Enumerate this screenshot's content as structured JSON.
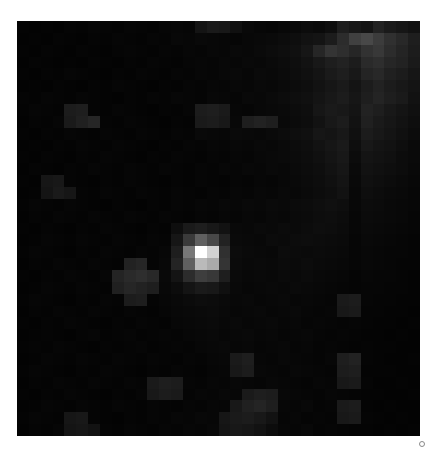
{
  "figure": {
    "type": "astronomical-image",
    "title": "",
    "background_color": "#ffffff",
    "panel": {
      "x": 17,
      "y": 21,
      "width": 403,
      "height": 415,
      "background_color": "#000000",
      "border": "none"
    },
    "marker": {
      "name": "corner-dot-marker",
      "shape": "circle",
      "x": 422,
      "y": 444,
      "diameter_px": 6,
      "stroke_color": "#8a8a8a",
      "fill_color": "#ffffff"
    }
  },
  "chart_data": {
    "type": "heatmap",
    "title": "",
    "subtitle": "",
    "xlabel": "",
    "ylabel": "",
    "colormap": "gray",
    "grid": false,
    "legend": "none",
    "xticks": [],
    "yticks": [],
    "cols": 34,
    "rows": 35,
    "cell_px": 11.85,
    "vmin": 0,
    "vmax": 255,
    "annotations": [
      {
        "label": "central point source",
        "col": 17,
        "row": 18,
        "peak_value": 255
      },
      {
        "label": "secondary faint clump",
        "col": 9,
        "row": 20,
        "peak_value": 46
      },
      {
        "label": "bright upper-right noise patch",
        "col": 30,
        "row": 1,
        "peak_value": 72
      }
    ],
    "values": [
      [
        4,
        3,
        4,
        3,
        5,
        4,
        6,
        5,
        4,
        6,
        5,
        4,
        6,
        7,
        6,
        20,
        26,
        24,
        16,
        9,
        7,
        6,
        8,
        9,
        12,
        10,
        14,
        30,
        24,
        20,
        34,
        26,
        22,
        18
      ],
      [
        3,
        4,
        3,
        5,
        4,
        3,
        5,
        4,
        6,
        5,
        4,
        6,
        5,
        8,
        7,
        9,
        8,
        7,
        6,
        8,
        9,
        10,
        12,
        14,
        18,
        20,
        28,
        44,
        64,
        72,
        60,
        48,
        40,
        30
      ],
      [
        4,
        3,
        5,
        4,
        3,
        5,
        4,
        3,
        5,
        6,
        5,
        4,
        6,
        5,
        7,
        6,
        8,
        7,
        9,
        8,
        10,
        12,
        14,
        16,
        22,
        38,
        52,
        46,
        38,
        50,
        56,
        44,
        36,
        28
      ],
      [
        3,
        5,
        4,
        3,
        4,
        3,
        5,
        4,
        3,
        5,
        4,
        6,
        5,
        4,
        6,
        7,
        6,
        8,
        7,
        9,
        8,
        10,
        12,
        14,
        18,
        24,
        30,
        34,
        28,
        42,
        46,
        38,
        34,
        26
      ],
      [
        4,
        3,
        5,
        4,
        6,
        5,
        4,
        3,
        5,
        4,
        6,
        5,
        4,
        6,
        5,
        7,
        6,
        8,
        9,
        7,
        10,
        9,
        11,
        13,
        16,
        20,
        26,
        30,
        24,
        36,
        40,
        32,
        28,
        22
      ],
      [
        3,
        4,
        3,
        5,
        4,
        3,
        5,
        4,
        6,
        5,
        4,
        3,
        5,
        4,
        6,
        5,
        7,
        6,
        8,
        7,
        9,
        8,
        10,
        12,
        14,
        18,
        22,
        26,
        20,
        28,
        34,
        28,
        24,
        20
      ],
      [
        5,
        4,
        6,
        5,
        4,
        6,
        5,
        4,
        3,
        5,
        4,
        6,
        5,
        7,
        6,
        5,
        8,
        7,
        6,
        9,
        8,
        10,
        12,
        14,
        16,
        20,
        24,
        28,
        22,
        30,
        36,
        30,
        26,
        18
      ],
      [
        4,
        6,
        5,
        4,
        28,
        30,
        5,
        4,
        6,
        5,
        4,
        3,
        5,
        4,
        6,
        28,
        30,
        26,
        7,
        6,
        8,
        9,
        10,
        12,
        14,
        22,
        26,
        24,
        20,
        34,
        30,
        24,
        20,
        16
      ],
      [
        3,
        5,
        4,
        6,
        26,
        32,
        38,
        5,
        4,
        6,
        5,
        4,
        3,
        5,
        4,
        26,
        28,
        24,
        8,
        30,
        34,
        30,
        9,
        11,
        13,
        18,
        24,
        28,
        18,
        32,
        26,
        22,
        18,
        14
      ],
      [
        4,
        3,
        5,
        4,
        6,
        5,
        4,
        6,
        5,
        4,
        6,
        5,
        4,
        6,
        5,
        9,
        8,
        7,
        10,
        9,
        8,
        10,
        12,
        14,
        16,
        22,
        20,
        24,
        16,
        28,
        24,
        20,
        16,
        12
      ],
      [
        3,
        4,
        3,
        5,
        4,
        6,
        5,
        4,
        6,
        5,
        4,
        3,
        5,
        4,
        6,
        5,
        7,
        6,
        8,
        7,
        9,
        8,
        10,
        12,
        14,
        18,
        22,
        26,
        14,
        24,
        20,
        18,
        14,
        10
      ],
      [
        4,
        3,
        5,
        4,
        3,
        5,
        4,
        6,
        5,
        4,
        3,
        5,
        4,
        6,
        5,
        4,
        6,
        5,
        7,
        6,
        8,
        9,
        10,
        11,
        13,
        16,
        20,
        24,
        12,
        20,
        18,
        16,
        12,
        10
      ],
      [
        3,
        5,
        4,
        3,
        5,
        4,
        6,
        5,
        4,
        6,
        5,
        4,
        6,
        5,
        4,
        6,
        5,
        7,
        6,
        8,
        7,
        9,
        8,
        10,
        12,
        14,
        18,
        22,
        10,
        18,
        16,
        14,
        12,
        9
      ],
      [
        4,
        3,
        22,
        24,
        5,
        4,
        3,
        5,
        4,
        6,
        5,
        4,
        3,
        5,
        4,
        6,
        5,
        4,
        6,
        5,
        7,
        6,
        8,
        9,
        11,
        13,
        16,
        20,
        9,
        16,
        14,
        12,
        10,
        8
      ],
      [
        3,
        4,
        20,
        26,
        22,
        5,
        4,
        6,
        5,
        4,
        6,
        5,
        4,
        6,
        5,
        4,
        6,
        5,
        7,
        6,
        8,
        7,
        9,
        8,
        10,
        12,
        14,
        18,
        8,
        14,
        12,
        10,
        9,
        7
      ],
      [
        4,
        6,
        5,
        4,
        6,
        5,
        4,
        3,
        5,
        4,
        3,
        5,
        4,
        6,
        5,
        7,
        6,
        8,
        7,
        9,
        8,
        10,
        9,
        11,
        12,
        14,
        16,
        14,
        8,
        12,
        11,
        9,
        8,
        7
      ],
      [
        3,
        5,
        4,
        6,
        5,
        4,
        6,
        5,
        4,
        6,
        5,
        4,
        6,
        5,
        4,
        6,
        5,
        7,
        6,
        8,
        7,
        9,
        8,
        10,
        11,
        13,
        14,
        12,
        7,
        11,
        10,
        9,
        8,
        6
      ],
      [
        4,
        3,
        5,
        4,
        3,
        5,
        4,
        6,
        5,
        4,
        3,
        5,
        4,
        14,
        26,
        30,
        24,
        18,
        9,
        8,
        10,
        9,
        11,
        10,
        12,
        14,
        13,
        11,
        7,
        10,
        9,
        8,
        7,
        6
      ],
      [
        3,
        4,
        6,
        5,
        4,
        6,
        5,
        4,
        6,
        5,
        4,
        6,
        5,
        22,
        58,
        96,
        72,
        34,
        10,
        9,
        8,
        11,
        10,
        12,
        13,
        12,
        11,
        10,
        6,
        9,
        8,
        7,
        6,
        5
      ],
      [
        4,
        6,
        5,
        4,
        3,
        5,
        4,
        6,
        5,
        4,
        6,
        5,
        7,
        30,
        120,
        255,
        210,
        48,
        12,
        10,
        9,
        8,
        12,
        11,
        10,
        11,
        10,
        9,
        6,
        8,
        7,
        6,
        6,
        5
      ],
      [
        3,
        5,
        4,
        6,
        5,
        4,
        6,
        5,
        4,
        34,
        38,
        5,
        8,
        36,
        96,
        186,
        170,
        52,
        11,
        9,
        10,
        9,
        11,
        10,
        12,
        10,
        9,
        8,
        6,
        8,
        7,
        6,
        5,
        5
      ],
      [
        4,
        3,
        5,
        4,
        6,
        5,
        4,
        6,
        36,
        42,
        46,
        40,
        9,
        20,
        44,
        62,
        56,
        30,
        10,
        8,
        9,
        8,
        10,
        9,
        11,
        9,
        8,
        7,
        5,
        7,
        6,
        6,
        5,
        4
      ],
      [
        3,
        4,
        6,
        5,
        4,
        6,
        5,
        4,
        32,
        38,
        34,
        30,
        8,
        12,
        20,
        26,
        24,
        16,
        9,
        7,
        8,
        9,
        8,
        10,
        9,
        8,
        7,
        6,
        5,
        6,
        6,
        5,
        5,
        4
      ],
      [
        4,
        6,
        5,
        4,
        3,
        5,
        4,
        6,
        5,
        28,
        30,
        5,
        7,
        9,
        11,
        13,
        12,
        10,
        8,
        9,
        7,
        8,
        9,
        7,
        8,
        7,
        6,
        26,
        28,
        6,
        5,
        5,
        4,
        4
      ],
      [
        3,
        5,
        4,
        6,
        5,
        4,
        6,
        5,
        4,
        6,
        5,
        4,
        6,
        8,
        9,
        10,
        11,
        9,
        7,
        8,
        9,
        7,
        8,
        9,
        7,
        6,
        7,
        24,
        26,
        5,
        5,
        4,
        4,
        3
      ],
      [
        4,
        3,
        5,
        4,
        6,
        5,
        4,
        3,
        5,
        4,
        6,
        5,
        4,
        7,
        8,
        9,
        10,
        8,
        9,
        7,
        8,
        9,
        7,
        8,
        6,
        7,
        6,
        5,
        6,
        5,
        4,
        4,
        3,
        4
      ],
      [
        3,
        4,
        5,
        4,
        3,
        5,
        6,
        4,
        5,
        6,
        4,
        5,
        6,
        5,
        7,
        8,
        9,
        7,
        8,
        9,
        7,
        8,
        6,
        7,
        8,
        6,
        5,
        6,
        5,
        4,
        4,
        3,
        4,
        3
      ],
      [
        4,
        5,
        4,
        6,
        5,
        4,
        3,
        5,
        4,
        5,
        6,
        4,
        5,
        6,
        5,
        7,
        8,
        9,
        7,
        8,
        6,
        7,
        8,
        6,
        7,
        5,
        6,
        5,
        4,
        5,
        4,
        4,
        3,
        3
      ],
      [
        3,
        4,
        6,
        5,
        4,
        6,
        5,
        4,
        6,
        5,
        4,
        6,
        5,
        4,
        6,
        5,
        7,
        8,
        26,
        30,
        7,
        6,
        8,
        7,
        6,
        5,
        7,
        30,
        34,
        5,
        4,
        3,
        3,
        4
      ],
      [
        4,
        6,
        5,
        4,
        3,
        5,
        4,
        6,
        5,
        4,
        3,
        5,
        4,
        6,
        5,
        4,
        6,
        7,
        24,
        28,
        8,
        7,
        6,
        8,
        7,
        6,
        5,
        28,
        30,
        4,
        4,
        4,
        3,
        3
      ],
      [
        3,
        5,
        4,
        6,
        5,
        4,
        6,
        5,
        4,
        6,
        5,
        26,
        30,
        28,
        6,
        5,
        7,
        6,
        8,
        7,
        6,
        8,
        7,
        6,
        5,
        7,
        6,
        24,
        26,
        5,
        3,
        3,
        4,
        3
      ],
      [
        4,
        3,
        5,
        4,
        6,
        5,
        4,
        3,
        5,
        4,
        6,
        24,
        28,
        26,
        5,
        7,
        6,
        8,
        7,
        26,
        30,
        28,
        8,
        7,
        6,
        5,
        7,
        6,
        5,
        4,
        4,
        3,
        3,
        4
      ],
      [
        3,
        4,
        6,
        5,
        4,
        6,
        5,
        4,
        6,
        5,
        4,
        6,
        5,
        4,
        6,
        5,
        7,
        6,
        24,
        32,
        36,
        30,
        7,
        6,
        8,
        5,
        6,
        26,
        28,
        4,
        3,
        4,
        3,
        3
      ],
      [
        4,
        6,
        5,
        4,
        22,
        24,
        5,
        4,
        3,
        5,
        4,
        6,
        5,
        7,
        6,
        8,
        7,
        22,
        26,
        28,
        24,
        18,
        6,
        7,
        5,
        6,
        5,
        24,
        26,
        5,
        4,
        3,
        4,
        3
      ],
      [
        3,
        5,
        4,
        6,
        20,
        22,
        18,
        5,
        4,
        6,
        5,
        4,
        6,
        5,
        7,
        6,
        8,
        20,
        24,
        22,
        18,
        12,
        7,
        6,
        8,
        5,
        6,
        5,
        4,
        4,
        3,
        4,
        3,
        4
      ]
    ]
  }
}
